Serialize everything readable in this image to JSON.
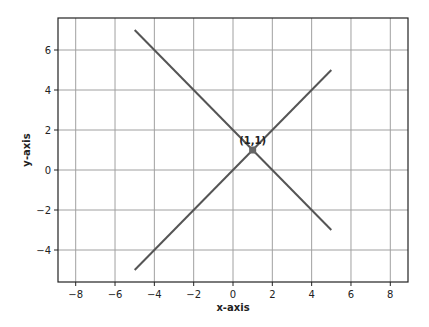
{
  "chart_data": {
    "type": "line",
    "title": "",
    "xlabel": "x-axis",
    "ylabel": "y-axis",
    "xlim": [
      -8.9,
      8.9
    ],
    "ylim": [
      -5.6,
      7.6
    ],
    "xticks": [
      -8,
      -6,
      -4,
      -2,
      0,
      2,
      4,
      6,
      8
    ],
    "yticks": [
      -4,
      -2,
      0,
      2,
      4,
      6
    ],
    "xtick_labels": [
      "−8",
      "−6",
      "−4",
      "−2",
      "0",
      "2",
      "4",
      "6",
      "8"
    ],
    "ytick_labels": [
      "−4",
      "−2",
      "0",
      "2",
      "4",
      "6"
    ],
    "grid": true,
    "legend": null,
    "series": [
      {
        "name": "line1",
        "x": [
          -5,
          5
        ],
        "y": [
          7,
          -3
        ],
        "color": "#555555"
      },
      {
        "name": "line2",
        "x": [
          -5,
          5
        ],
        "y": [
          -5,
          5
        ],
        "color": "#555555"
      }
    ],
    "annotations": [
      {
        "text": "(1,1)",
        "x": 1,
        "y": 1,
        "marker": true
      }
    ]
  },
  "frame": {
    "left": 58,
    "top": 18,
    "right": 408,
    "bottom": 282
  },
  "colors": {
    "line": "#555555",
    "grid": "#a0a0a0",
    "frame": "#222222",
    "text": "#222222"
  }
}
